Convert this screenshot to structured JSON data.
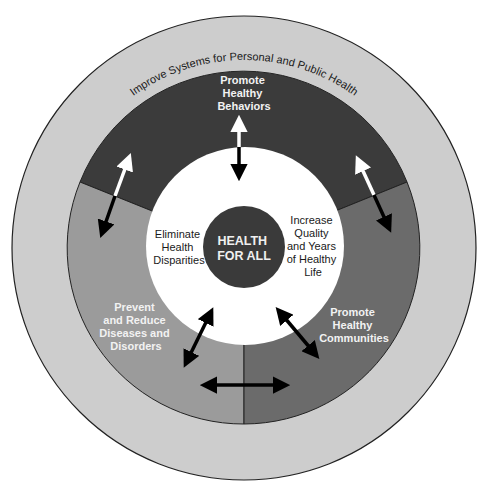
{
  "diagram": {
    "outer_ring": {
      "label": "Improve Systems for Personal and Public Health",
      "color": "#cdcdcd"
    },
    "sectors": [
      {
        "id": "behaviors",
        "lines": [
          "Promote",
          "Healthy",
          "Behaviors"
        ],
        "color": "#3b3b3b"
      },
      {
        "id": "diseases",
        "lines": [
          "Prevent",
          "and Reduce",
          "Diseases and",
          "Disorders"
        ],
        "color": "#9b9b9b"
      },
      {
        "id": "communities",
        "lines": [
          "Promote",
          "Healthy",
          "Communities"
        ],
        "color": "#6b6b6b"
      }
    ],
    "inner_goals": {
      "left": [
        "Eliminate",
        "Health",
        "Disparities"
      ],
      "right": [
        "Increase",
        "Quality",
        "and Years",
        "of Healthy",
        "Life"
      ]
    },
    "center": {
      "lines": [
        "HEALTH",
        "FOR ALL"
      ],
      "color": "#3a3a3a"
    },
    "arrow_icons": [
      "arrow-top-bidirectional-icon",
      "arrow-upper-left-bidirectional-icon",
      "arrow-upper-right-bidirectional-icon",
      "arrow-lower-left-bidirectional-icon",
      "arrow-lower-right-bidirectional-icon",
      "arrow-bottom-horizontal-bidirectional-icon"
    ]
  }
}
